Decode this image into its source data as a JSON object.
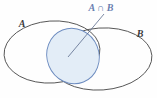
{
  "figure": {
    "name": "venn-diagram-intersection",
    "background_color": "#fefefe",
    "width": 157,
    "height": 98
  },
  "labels": {
    "set_a": "A",
    "set_b": "B",
    "intersection": "A ∩ B"
  },
  "colors": {
    "ellipse_stroke": "#4a4a4a",
    "intersection_stroke": "#6d8cc0",
    "intersection_fill": "#e3edf7",
    "intersection_label": "#6a7fb0",
    "set_label": "#3b3b3b",
    "leader_line": "#5b6b8c"
  },
  "geometry": {
    "ellipse_a": {
      "cx": 52,
      "cy": 52,
      "rx": 48,
      "ry": 31,
      "rotation": -4
    },
    "ellipse_b": {
      "cx": 101,
      "cy": 59,
      "rx": 51,
      "ry": 31,
      "rotation": -4
    },
    "intersection_ellipse": {
      "cx": 73,
      "cy": 56,
      "rx": 26,
      "ry": 28,
      "rotation": -22
    },
    "leader_line": {
      "x1": 104,
      "y1": 14,
      "x2": 68,
      "y2": 57
    }
  },
  "label_positions": {
    "set_a": {
      "x": 22,
      "y": 27
    },
    "set_b": {
      "x": 140,
      "y": 37
    },
    "intersection": {
      "x": 101,
      "y": 11
    }
  }
}
